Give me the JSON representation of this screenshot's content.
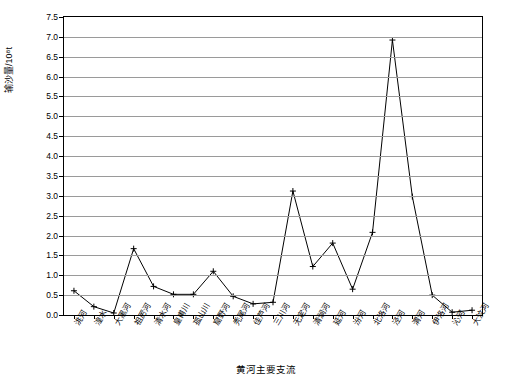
{
  "chart_data": {
    "type": "line",
    "title": "",
    "xlabel": "黄河主要支流",
    "ylabel": "输沙量/10⁸t",
    "ylim": [
      0.0,
      7.5
    ],
    "ystep": 0.5,
    "grid": true,
    "legend": "none",
    "marker": "cross",
    "ytick_labels": [
      "0.0",
      "0.5",
      "1.0",
      "1.5",
      "2.0",
      "2.5",
      "3.0",
      "3.5",
      "4.0",
      "4.5",
      "5.0",
      "5.5",
      "6.0",
      "6.5",
      "7.0",
      "7.5"
    ],
    "categories": [
      "洮河",
      "湟水",
      "大黑河",
      "祖厉河",
      "清水河",
      "皇甫川",
      "孤山川",
      "窟野河",
      "秃尾河",
      "佳芦河",
      "三川河",
      "无定河",
      "清涧河",
      "延河",
      "汾河",
      "北洛河",
      "泾河",
      "渭河",
      "伊洛河",
      "沁河",
      "大汶河"
    ],
    "values": [
      0.61,
      0.21,
      0.05,
      1.67,
      0.72,
      0.52,
      0.52,
      1.1,
      0.47,
      0.28,
      0.32,
      3.12,
      1.22,
      1.81,
      0.65,
      2.08,
      6.92,
      2.98,
      0.5,
      0.07,
      0.12
    ]
  }
}
